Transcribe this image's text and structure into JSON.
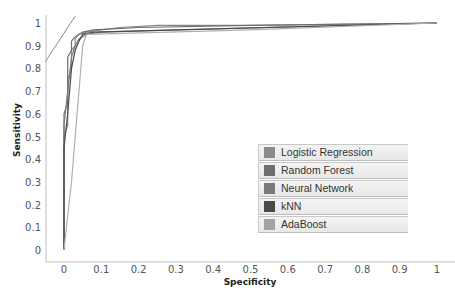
{
  "chart_data": {
    "type": "line",
    "title": "",
    "xlabel": "Specificity",
    "ylabel": "Sensitivity",
    "xlim": [
      0,
      1
    ],
    "ylim": [
      0,
      1
    ],
    "x_ticks": [
      "0",
      "0.1",
      "0.2",
      "0.3",
      "0.4",
      "0.5",
      "0.6",
      "0.7",
      "0.8",
      "0.9",
      "1"
    ],
    "y_ticks": [
      "0",
      "0.1",
      "0.2",
      "0.3",
      "0.4",
      "0.5",
      "0.6",
      "0.7",
      "0.8",
      "0.9",
      "1"
    ],
    "grid": false,
    "legend_position": "lower right",
    "series": [
      {
        "name": "Logistic Regression",
        "color": "#8a8a8a",
        "x": [
          0,
          0.0,
          0.01,
          0.01,
          0.02,
          0.02,
          0.03,
          0.03,
          0.04,
          0.06,
          0.1,
          0.15,
          0.25,
          0.3,
          0.5,
          1.0
        ],
        "y": [
          0,
          0.5,
          0.55,
          0.75,
          0.8,
          0.88,
          0.9,
          0.93,
          0.95,
          0.96,
          0.97,
          0.98,
          0.99,
          0.99,
          0.99,
          1.0
        ]
      },
      {
        "name": "Random Forest",
        "color": "#6e6e6e",
        "x": [
          0,
          0.0,
          0.01,
          0.01,
          0.02,
          0.02,
          0.03,
          0.05,
          0.08,
          0.2,
          0.5,
          1.0
        ],
        "y": [
          0,
          0.6,
          0.65,
          0.85,
          0.88,
          0.92,
          0.94,
          0.96,
          0.97,
          0.98,
          0.99,
          1.0
        ]
      },
      {
        "name": "Neural Network",
        "color": "#7a7a7a",
        "x": [
          0,
          0.0,
          0.01,
          0.02,
          0.03,
          0.04,
          0.06,
          0.1,
          0.3,
          1.0
        ],
        "y": [
          0,
          0.55,
          0.7,
          0.85,
          0.9,
          0.93,
          0.95,
          0.96,
          0.97,
          1.0
        ]
      },
      {
        "name": "kNN",
        "color": "#4a4a4a",
        "x": [
          0,
          0.0,
          0.01,
          0.02,
          0.03,
          0.04,
          0.05,
          0.08,
          1.0
        ],
        "y": [
          0,
          0.45,
          0.6,
          0.8,
          0.88,
          0.92,
          0.95,
          0.96,
          1.0
        ]
      },
      {
        "name": "AdaBoost",
        "color": "#b0b0b0",
        "x": [
          0,
          0.02,
          0.05,
          0.06,
          0.5,
          1.0
        ],
        "y": [
          0,
          0.3,
          0.9,
          0.95,
          0.97,
          1.0
        ]
      }
    ],
    "annotations": [
      {
        "type": "line",
        "description": "diagonal reference segment near top-left",
        "x": [
          -0.05,
          0.03
        ],
        "y": [
          0.83,
          1.03
        ]
      }
    ]
  },
  "legend": {
    "items": [
      {
        "label": "Logistic Regression",
        "color": "#8a8a8a"
      },
      {
        "label": "Random Forest",
        "color": "#6e6e6e"
      },
      {
        "label": "Neural Network",
        "color": "#7a7a7a"
      },
      {
        "label": "kNN",
        "color": "#4a4a4a"
      },
      {
        "label": "AdaBoost",
        "color": "#a3a3a3"
      }
    ]
  }
}
